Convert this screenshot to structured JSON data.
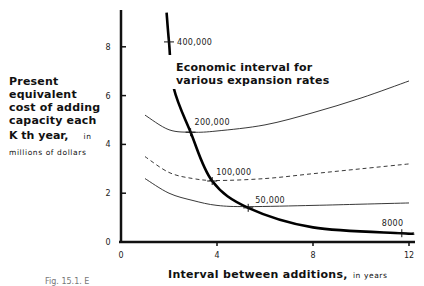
{
  "chart_data": {
    "type": "line",
    "title": "",
    "annotation": "Economic interval for various expansion rates",
    "xlabel": "Interval between additions, in years",
    "xlabel_main": "Interval between additions,",
    "xlabel_unit": "in years",
    "ylabel": "Present equivalent cost of adding capacity each Kth year, in millions of dollars",
    "ylabel_lines": [
      "Present equivalent",
      "cost of adding",
      "capacity each"
    ],
    "ylabel_line4_main": "K th  year,",
    "ylabel_line4_unit": "in",
    "ylabel_line5": "millions of dollars",
    "xlim": [
      0,
      12.3
    ],
    "ylim": [
      0,
      9.3
    ],
    "xticks": [
      0,
      4,
      8,
      12
    ],
    "xtick_labels": [
      "0",
      "4",
      "8",
      "12"
    ],
    "yticks": [
      0,
      2,
      4,
      6,
      8
    ],
    "ytick_labels": [
      "0",
      "2",
      "4",
      "6",
      "8"
    ],
    "grid": false,
    "legend": "none (curves labeled inline)",
    "series": [
      {
        "name": "200,000",
        "style": "solid-thin",
        "x": [
          1,
          2,
          3,
          4,
          6,
          8,
          10,
          12
        ],
        "y": [
          5.2,
          4.6,
          4.5,
          4.55,
          4.8,
          5.3,
          5.9,
          6.6
        ]
      },
      {
        "name": "100,000",
        "style": "dashed",
        "x": [
          1,
          2,
          3,
          4,
          6,
          8,
          10,
          12
        ],
        "y": [
          3.5,
          2.85,
          2.6,
          2.52,
          2.6,
          2.8,
          3.0,
          3.2
        ]
      },
      {
        "name": "50,000",
        "style": "solid-thin",
        "x": [
          1,
          2,
          3,
          4,
          5.3,
          8,
          10,
          12
        ],
        "y": [
          2.6,
          2.0,
          1.7,
          1.5,
          1.45,
          1.5,
          1.55,
          1.6
        ]
      },
      {
        "name": "Economic interval for various expansion rates",
        "style": "solid-thick",
        "x": [
          1.9,
          2.0,
          2.2,
          2.9,
          3.8,
          5.3,
          8.0,
          11.7,
          12.2
        ],
        "y": [
          9.4,
          8.2,
          6.3,
          4.5,
          2.5,
          1.4,
          0.6,
          0.36,
          0.35
        ],
        "marked_points": [
          {
            "label": "400,000",
            "x": 2.0,
            "y": 8.2
          },
          {
            "label": "200,000",
            "x": 2.9,
            "y": 4.5
          },
          {
            "label": "100,000",
            "x": 3.8,
            "y": 2.5
          },
          {
            "label": "50,000",
            "x": 5.3,
            "y": 1.4
          },
          {
            "label": "8000",
            "x": 11.7,
            "y": 0.36
          }
        ]
      }
    ]
  },
  "caption": "Fig. 15.1.  E"
}
